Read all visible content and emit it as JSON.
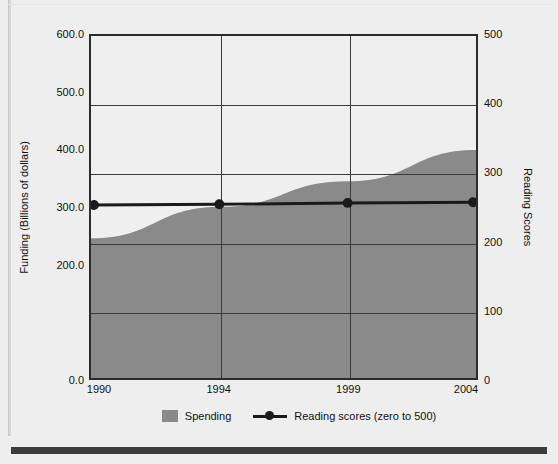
{
  "chart_data": {
    "type": "area",
    "title": "",
    "xlabel": "",
    "ylabel": "Funding (Billions of dollars)",
    "y2label": "Reading Scores",
    "categories": [
      "1990",
      "1994",
      "1999",
      "2004"
    ],
    "x": [
      1990,
      1994,
      1999,
      2004
    ],
    "ylim": [
      0,
      600
    ],
    "y2lim": [
      0,
      500
    ],
    "grid": true,
    "legend_position": "bottom",
    "yticks_left": [
      "600.0",
      "500.0",
      "400.0",
      "300.0",
      "200.0",
      "0.0"
    ],
    "yticks_left_values": [
      600,
      500,
      400,
      300,
      200,
      0
    ],
    "yticks_right": [
      "500",
      "400",
      "300",
      "200",
      "100",
      "0"
    ],
    "yticks_right_values": [
      500,
      400,
      300,
      200,
      100,
      0
    ],
    "series": [
      {
        "name": "Spending",
        "kind": "area",
        "axis": "left",
        "color": "#8a8a8a",
        "values": [
          245,
          300,
          345,
          400
        ]
      },
      {
        "name": "Reading scores (zero to 500)",
        "kind": "line",
        "axis": "right",
        "color": "#1a1a1a",
        "values": [
          253,
          254,
          256,
          257
        ]
      }
    ]
  },
  "axes": {
    "left": {
      "title": "Funding (Billions of dollars)",
      "ticks": [
        "600.0",
        "500.0",
        "400.0",
        "300.0",
        "200.0",
        "0.0"
      ]
    },
    "right": {
      "title": "Reading Scores",
      "ticks": [
        "500",
        "400",
        "300",
        "200",
        "100",
        "0"
      ]
    },
    "bottom": {
      "ticks": [
        "1990",
        "1994",
        "1999",
        "2004"
      ]
    }
  },
  "legend": {
    "items": [
      {
        "label": "Spending",
        "marker": "swatch-icon",
        "color": "#8a8a8a"
      },
      {
        "label": "Reading scores (zero to 500)",
        "marker": "line-marker-icon",
        "color": "#1a1a1a"
      }
    ]
  },
  "colors": {
    "area_fill": "#8a8a8a",
    "line": "#1a1a1a",
    "plot_background": "#efefef",
    "figure_background": "#eeeeee",
    "grid": "#3a3a3a",
    "bottom_bar": "#3c3c3c"
  }
}
